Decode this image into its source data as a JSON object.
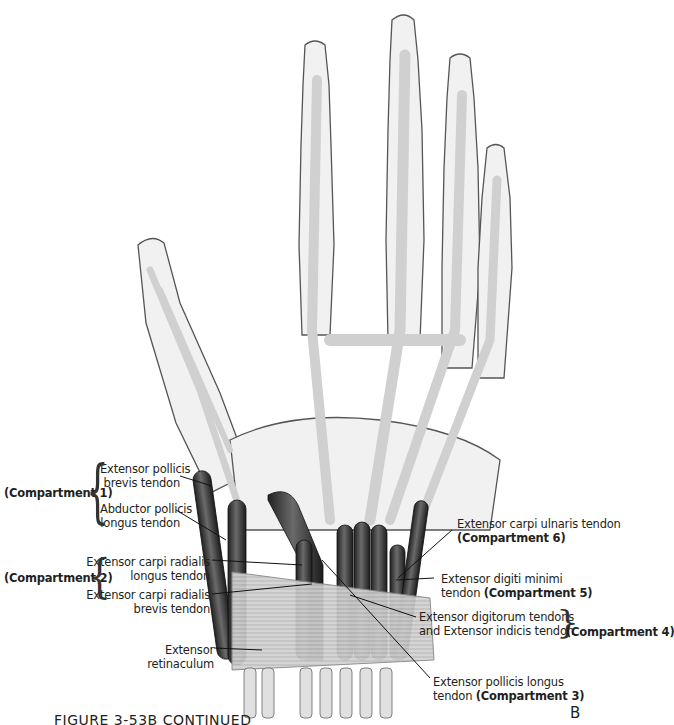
{
  "figure": {
    "caption": "FIGURE 3-53B CONTINUED",
    "panel_letter": "B"
  },
  "colors": {
    "bone_fill": "#f2f2f2",
    "bone_outline": "#4a4a4a",
    "tendon_light": "#d4d4d4",
    "tendon_dark": "#3a3a3a",
    "retinaculum": "#c8c8c8"
  },
  "labels": {
    "left": [
      {
        "id": "epb",
        "text_line1": "Extensor pollicis",
        "text_line2": "brevis tendon"
      },
      {
        "id": "apl",
        "text_line1": "Abductor pollicis",
        "text_line2": "longus tendon"
      },
      {
        "id": "ecrl",
        "text_line1": "Extensor carpi radialis",
        "text_line2": "longus tendon"
      },
      {
        "id": "ecrb",
        "text_line1": "Extensor carpi radialis",
        "text_line2": "brevis tendon"
      },
      {
        "id": "ret",
        "text_line1": "Extensor",
        "text_line2": "retinaculum"
      }
    ],
    "right": [
      {
        "id": "ecu",
        "text_line1": "Extensor carpi ulnaris tendon",
        "text_line2_bold": "(Compartment 6)"
      },
      {
        "id": "edm",
        "text_line1": "Extensor digiti minimi",
        "text_line2": "tendon ",
        "text_line2_bold": "(Compartment 5)"
      },
      {
        "id": "ed",
        "text_line1": "Extensor digitorum tendons",
        "text_line2": "and Extensor indicis tendon"
      },
      {
        "id": "epl",
        "text_line1": "Extensor pollicis longus",
        "text_line2": "tendon ",
        "text_line2_bold": "(Compartment 3)"
      }
    ],
    "compartments": {
      "c1": "(Compartment 1)",
      "c2": "(Compartment 2)",
      "c4": "(Compartment 4)"
    }
  }
}
